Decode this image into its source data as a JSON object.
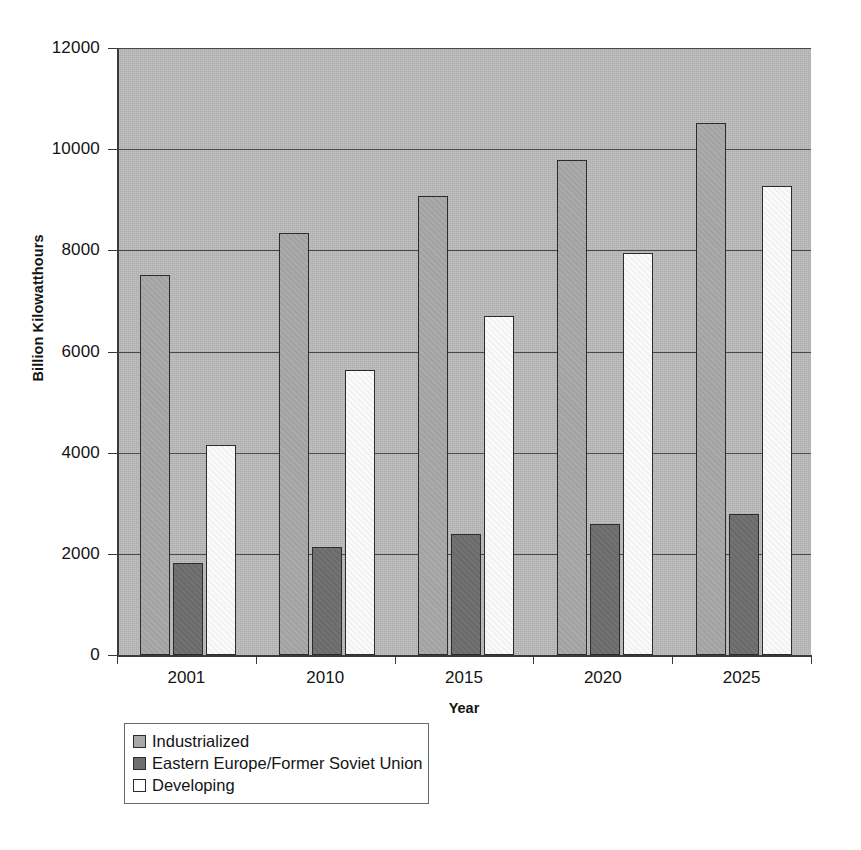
{
  "chart_data": {
    "type": "bar",
    "title": "",
    "subtitle": "",
    "xlabel": "Year",
    "ylabel": "Billion Kilowatthours",
    "categories": [
      "2001",
      "2010",
      "2015",
      "2020",
      "2025"
    ],
    "series": [
      {
        "name": "Industrialized",
        "color": "#a8a8a8",
        "values": [
          7510,
          8340,
          9070,
          9790,
          10520
        ]
      },
      {
        "name": "Eastern Europe/Former Soviet Union",
        "color": "#6e6e6e",
        "values": [
          1820,
          2135,
          2390,
          2590,
          2790
        ]
      },
      {
        "name": "Developing",
        "color": "#ffffff",
        "values": [
          4150,
          5630,
          6700,
          7940,
          9270
        ]
      }
    ],
    "ylim": [
      0,
      12000
    ],
    "ytick_labels": [
      "0",
      "2000",
      "4000",
      "6000",
      "8000",
      "10000",
      "12000"
    ],
    "ytick_values": [
      0,
      2000,
      4000,
      6000,
      8000,
      10000,
      12000
    ],
    "grid": true,
    "grid_axis": "y",
    "legend_position": "bottom-left",
    "legend_entries": [
      "Industrialized",
      "Eastern Europe/Former Soviet Union",
      "Developing"
    ],
    "plot_background": "#b9b9b9",
    "bar_border_color": "#2c2c2c",
    "axis_color": "#3a3a3a"
  }
}
